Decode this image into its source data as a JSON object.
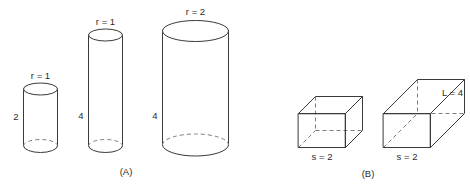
{
  "figure": {
    "background_color": "#ffffff",
    "stroke_color": "#3a3a3a",
    "hidden_stroke_color": "#7d7d7d",
    "text_color": "#2b2b2b",
    "panels": [
      {
        "id": "A",
        "caption": "(A)",
        "kind": "cylinders",
        "shapes": [
          {
            "name": "cylinder-small",
            "radius_label": "r = 1",
            "height_label": "2",
            "radius": 1,
            "height": 2
          },
          {
            "name": "cylinder-tall-thin",
            "radius_label": "r = 1",
            "height_label": "4",
            "radius": 1,
            "height": 4
          },
          {
            "name": "cylinder-tall-wide",
            "radius_label": "r = 2",
            "height_label": "4",
            "radius": 2,
            "height": 4
          }
        ]
      },
      {
        "id": "B",
        "caption": "(B)",
        "kind": "boxes",
        "shapes": [
          {
            "name": "box-cube",
            "side_label": "s = 2",
            "side": 2
          },
          {
            "name": "box-long",
            "side_label": "s = 2",
            "length_label": "L = 4",
            "side": 2,
            "length": 4
          }
        ]
      }
    ]
  },
  "labels": {
    "cyl1_r": "r = 1",
    "cyl1_h": "2",
    "cyl2_r": "r = 1",
    "cyl2_h": "4",
    "cyl3_r": "r = 2",
    "cyl3_h": "4",
    "caption_a": "(A)",
    "box1_s": "s = 2",
    "box2_s": "s = 2",
    "box2_L": "L = 4",
    "caption_b": "(B)"
  }
}
